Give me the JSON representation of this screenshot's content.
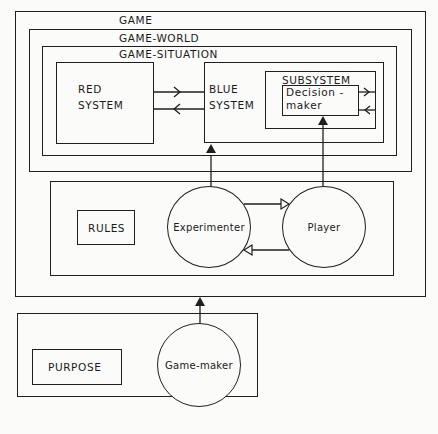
{
  "diagram": {
    "game": {
      "label": "GAME"
    },
    "game_world": {
      "label": "GAME-WORLD"
    },
    "game_situation": {
      "label": "GAME-SITUATION"
    },
    "red_system": {
      "line1": "RED",
      "line2": "SYSTEM"
    },
    "blue_system": {
      "line1": "BLUE",
      "line2": "SYSTEM"
    },
    "subsystem": {
      "label": "SUBSYSTEM"
    },
    "decision_maker": {
      "line1": "Decision -",
      "line2": "maker"
    },
    "rules": {
      "label": "RULES"
    },
    "experimenter": {
      "label": "Experimenter"
    },
    "player": {
      "label": "Player"
    },
    "purpose": {
      "label": "PURPOSE"
    },
    "game_maker": {
      "label": "Game-maker"
    }
  }
}
